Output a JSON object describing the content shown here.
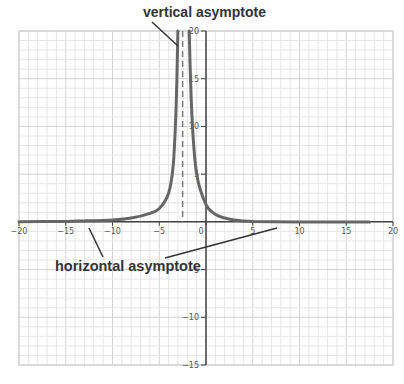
{
  "chart_data": {
    "type": "line",
    "title": "",
    "xlabel": "",
    "ylabel": "",
    "xlim": [
      -20,
      20
    ],
    "ylim": [
      -15,
      20
    ],
    "grid": true,
    "x_ticks": [
      -20,
      -15,
      -10,
      -5,
      0,
      5,
      10,
      15,
      20
    ],
    "x_tick_labels": [
      "-20",
      "-15",
      "-10",
      "-5",
      "0",
      "5",
      "10",
      "15",
      "20"
    ],
    "y_ticks": [
      -15,
      -10,
      -5,
      5,
      10,
      15,
      20
    ],
    "y_tick_labels": [
      "-15",
      "-10",
      "-5",
      "5",
      "10",
      "15",
      "20"
    ],
    "vertical_asymptote_x": -2.5,
    "horizontal_asymptote_y": 0,
    "series": [
      {
        "name": "f(x)",
        "color": "#666666",
        "description": "Curve with vertical asymptote at x = -2.5 and horizontal asymptote y = 0; both branches go to +infinity near the asymptote",
        "x": [
          -20,
          -15,
          -13,
          -10,
          -8,
          -6,
          -5,
          -4,
          -3.5,
          -3.2,
          -3.0,
          -1.8,
          -1.5,
          -1,
          0,
          1,
          2,
          3,
          4,
          5,
          7,
          10,
          15,
          17.5
        ],
        "y": [
          0.02,
          0.05,
          0.1,
          0.2,
          0.4,
          0.9,
          1.4,
          3.0,
          6.0,
          12.0,
          20,
          20,
          11.0,
          5.0,
          1.8,
          0.8,
          0.4,
          0.2,
          0.1,
          0.03,
          0.01,
          0.0,
          0.0,
          0.0
        ]
      }
    ],
    "annotations": [
      {
        "text": "vertical asymptote",
        "points_to": [
          -2.5,
          18
        ]
      },
      {
        "text": "horizontal asymptote",
        "points_to": [
          [
            -12,
            0
          ],
          [
            8,
            0
          ]
        ]
      }
    ]
  },
  "annotations": {
    "vertical": "vertical asymptote",
    "horizontal": "horizontal asymptote"
  },
  "colors": {
    "curve": "#666666",
    "axis": "#444444",
    "grid_minor": "#e6e6e6",
    "grid_major": "#d2d2d2",
    "asymptote": "#777777",
    "pointer": "#333333"
  }
}
